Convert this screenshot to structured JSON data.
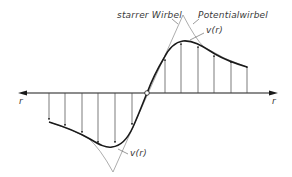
{
  "diagram": {
    "type": "vortex velocity profile",
    "labels": {
      "rigid_vortex": "starrer Wirbel",
      "potential_vortex": "Potentialwirbel",
      "velocity_upper": "v(r)",
      "velocity_lower": "v(r)",
      "axis_left": "r",
      "axis_right": "r"
    },
    "colors": {
      "curve": "#1a1a1a",
      "arrows": "#555555",
      "guide_lines": "#8a8a8a",
      "axis": "#1a1a1a"
    }
  }
}
